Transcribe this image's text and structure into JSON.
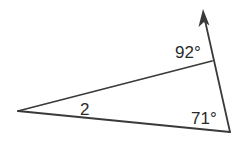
{
  "diagram": {
    "type": "geometry-triangle",
    "colors": {
      "stroke": "#3a3a3a",
      "text": "#2a2a2a",
      "background": "#ffffff"
    },
    "vertices": {
      "left": {
        "x": 18,
        "y": 111
      },
      "top_right": {
        "x": 212,
        "y": 61
      },
      "bottom_right": {
        "x": 230,
        "y": 132
      }
    },
    "ray": {
      "from": {
        "x": 230,
        "y": 132
      },
      "to": {
        "x": 203,
        "y": 10
      },
      "arrowhead": true
    },
    "labels": {
      "exterior_angle": "92°",
      "bottom_right_angle": "71°",
      "angle_2": "2"
    }
  }
}
